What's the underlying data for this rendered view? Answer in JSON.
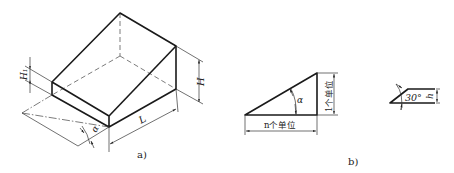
{
  "figure": {
    "panel_a": {
      "caption": "a)",
      "labels": {
        "height": "H",
        "front_height": "H₁",
        "length": "L",
        "angle": "α"
      }
    },
    "panel_b": {
      "caption": "b)",
      "labels": {
        "angle": "α",
        "vertical": "1个单位",
        "horizontal": "n个单位"
      }
    },
    "panel_c": {
      "labels": {
        "angle": "30°",
        "height": "h"
      }
    }
  }
}
